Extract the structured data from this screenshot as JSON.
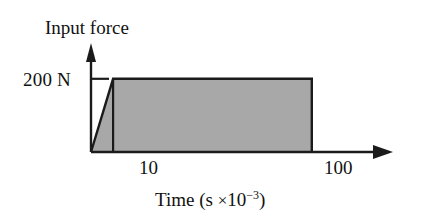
{
  "figure": {
    "background_color": "#ffffff",
    "line_color": "#111111",
    "fill_color": "#a8a8a8"
  },
  "labels": {
    "y_axis_title": "Input force",
    "y_tick_200": "200 N",
    "x_tick_10": "10",
    "x_tick_100": "100",
    "x_axis_title_prefix": "Time (s ",
    "x_axis_title_times": "×",
    "x_axis_title_base": "10",
    "x_axis_title_exponent": "−3",
    "x_axis_title_suffix": ")"
  },
  "chart_data": {
    "type": "area",
    "title": "",
    "xlabel": "Time (s ×10⁻³)",
    "ylabel": "Input force",
    "x": [
      0,
      10,
      100,
      100
    ],
    "values": [
      0,
      200,
      200,
      0
    ],
    "series": [
      {
        "name": "Input force",
        "points": [
          {
            "x": 0,
            "y": 0
          },
          {
            "x": 10,
            "y": 200
          },
          {
            "x": 100,
            "y": 200
          },
          {
            "x": 100,
            "y": 0
          }
        ]
      }
    ],
    "x_tick_labels": [
      "10",
      "100"
    ],
    "x_tick_values": [
      10,
      100
    ],
    "y_tick_labels": [
      "200 N"
    ],
    "y_tick_values": [
      200
    ],
    "y_units": "N",
    "x_units": "s ×10⁻³",
    "xlim": [
      0,
      130
    ],
    "ylim": [
      0,
      265
    ],
    "grid": false,
    "legend": false,
    "annotations": [
      "Ramp rises linearly from 0 N at t=0 to 200 N at t=10×10⁻³ s",
      "Constant 200 N plateau from t=10×10⁻³ s to t=100×10⁻³ s",
      "Force drops to 0 N at t=100×10⁻³ s"
    ],
    "shaded_region": true,
    "divider_at_x": 10
  }
}
